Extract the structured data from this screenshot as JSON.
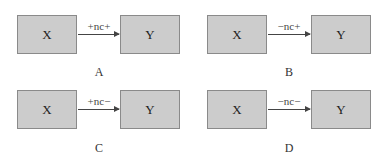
{
  "panels": [
    {
      "id": "A",
      "x_label": "X",
      "y_label": "Y",
      "arrow_label": "+nc+",
      "panel_label": "A"
    },
    {
      "id": "B",
      "x_label": "X",
      "y_label": "Y",
      "arrow_label": "−nc+",
      "panel_label": "B"
    },
    {
      "id": "C",
      "x_label": "X",
      "y_label": "Y",
      "arrow_label": "+nc−",
      "panel_label": "C"
    },
    {
      "id": "D",
      "x_label": "X",
      "y_label": "Y",
      "arrow_label": "−nc−",
      "panel_label": "D"
    }
  ],
  "colors": {
    "box_fill": "#cccccc",
    "box_border": "#8a8a8a",
    "arrow": "#444444"
  }
}
